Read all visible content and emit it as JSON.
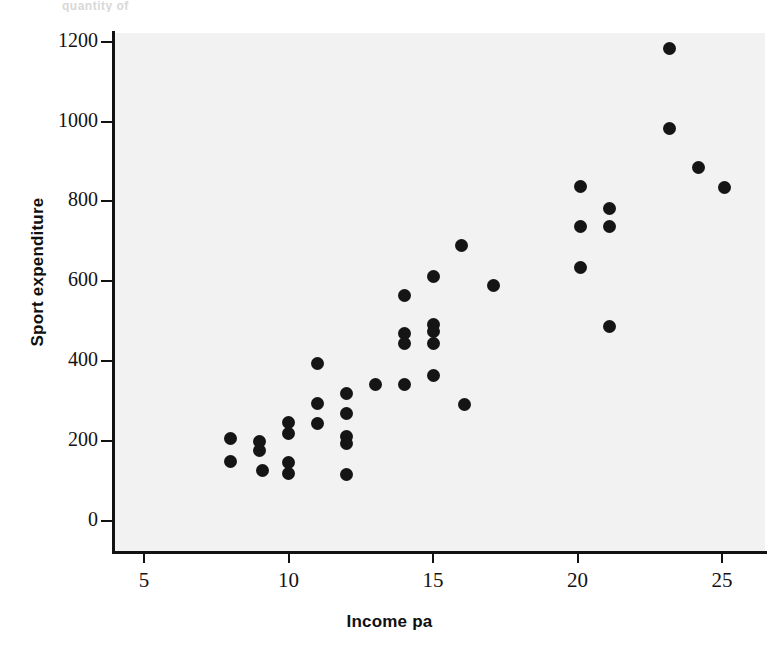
{
  "figure": {
    "top_fragment_text": "quantity of",
    "background_color": "#ffffff",
    "plot_background_color": "#f2f2f2",
    "marker_color": "#151515",
    "axis_color": "#121212"
  },
  "chart_data": {
    "type": "scatter",
    "title": "",
    "xlabel": "Income pa",
    "ylabel": "Sport expenditure",
    "xlim": [
      3.9,
      26.4
    ],
    "ylim": [
      -105,
      1305
    ],
    "xticks": [
      5,
      10,
      15,
      20,
      25
    ],
    "xticklabels": [
      "5",
      "10",
      "15",
      "20",
      "25"
    ],
    "yticks": [
      0,
      200,
      400,
      600,
      800,
      1000,
      1200
    ],
    "yticklabels": [
      "0",
      "200",
      "400",
      "600",
      "800",
      "1000",
      "1200"
    ],
    "grid": false,
    "legend": null,
    "marker": "filled-circle",
    "n_points": 44,
    "points": [
      {
        "x": 8.0,
        "y": 205
      },
      {
        "x": 8.0,
        "y": 148
      },
      {
        "x": 9.0,
        "y": 198
      },
      {
        "x": 9.0,
        "y": 175
      },
      {
        "x": 9.1,
        "y": 125
      },
      {
        "x": 10.0,
        "y": 245
      },
      {
        "x": 10.0,
        "y": 218
      },
      {
        "x": 10.0,
        "y": 145
      },
      {
        "x": 10.0,
        "y": 118
      },
      {
        "x": 11.0,
        "y": 395
      },
      {
        "x": 11.0,
        "y": 295
      },
      {
        "x": 11.0,
        "y": 243
      },
      {
        "x": 12.0,
        "y": 320
      },
      {
        "x": 12.0,
        "y": 268
      },
      {
        "x": 12.0,
        "y": 210
      },
      {
        "x": 12.0,
        "y": 193
      },
      {
        "x": 12.0,
        "y": 115
      },
      {
        "x": 13.0,
        "y": 342
      },
      {
        "x": 14.0,
        "y": 565
      },
      {
        "x": 14.0,
        "y": 470
      },
      {
        "x": 14.0,
        "y": 443
      },
      {
        "x": 14.0,
        "y": 342
      },
      {
        "x": 15.0,
        "y": 612
      },
      {
        "x": 15.0,
        "y": 492
      },
      {
        "x": 15.0,
        "y": 473
      },
      {
        "x": 15.0,
        "y": 443
      },
      {
        "x": 15.0,
        "y": 365
      },
      {
        "x": 16.0,
        "y": 690
      },
      {
        "x": 16.1,
        "y": 292
      },
      {
        "x": 17.1,
        "y": 590
      },
      {
        "x": 20.1,
        "y": 838
      },
      {
        "x": 20.1,
        "y": 737
      },
      {
        "x": 20.1,
        "y": 635
      },
      {
        "x": 21.1,
        "y": 782
      },
      {
        "x": 21.1,
        "y": 737
      },
      {
        "x": 21.1,
        "y": 487
      },
      {
        "x": 23.2,
        "y": 1183
      },
      {
        "x": 23.2,
        "y": 983
      },
      {
        "x": 24.2,
        "y": 885
      },
      {
        "x": 25.1,
        "y": 835
      }
    ]
  }
}
